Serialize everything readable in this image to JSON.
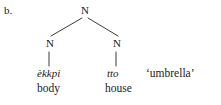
{
  "figure": {
    "example_label": "b.",
    "background_color": "#ffffff",
    "line_color": "#3a3a3a",
    "text_color": "#1a1a1a"
  },
  "tree": {
    "root": {
      "label": "N"
    },
    "children": [
      {
        "label": "N",
        "terminal_form": "èkkpi",
        "terminal_gloss": "body"
      },
      {
        "label": "N",
        "terminal_form": "tto",
        "terminal_gloss": "house"
      }
    ]
  },
  "translation": "‘umbrella’"
}
